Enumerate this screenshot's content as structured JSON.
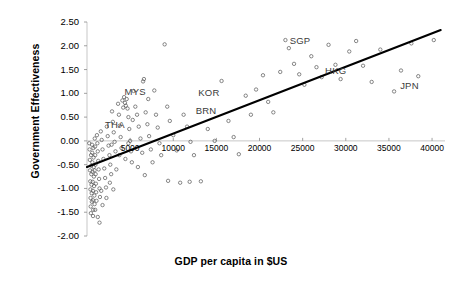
{
  "chart_data": {
    "type": "scatter",
    "title": "",
    "xlabel": "GDP per capita in $US",
    "ylabel": "Government Effectiveness",
    "xlim": [
      0,
      41500
    ],
    "ylim": [
      -2.0,
      2.5
    ],
    "xticks": [
      5000,
      10000,
      15000,
      20000,
      25000,
      30000,
      35000,
      40000
    ],
    "xtick_labels": [
      "5000",
      "10000",
      "15000",
      "20000",
      "25000",
      "30000",
      "35000",
      "40000"
    ],
    "yticks": [
      -2.0,
      -1.5,
      -1.0,
      -0.5,
      0.0,
      0.5,
      1.0,
      1.5,
      2.0,
      2.5
    ],
    "ytick_labels": [
      "-2.00",
      "-1.50",
      "-1.00",
      "-0.50",
      "0.00",
      "0.50",
      "1.00",
      "1.50",
      "2.00",
      "2.50"
    ],
    "grid": false,
    "legend": null,
    "marker": "open-circle",
    "trendline": {
      "type": "linear",
      "x0": 0,
      "y0": -0.55,
      "x1": 41000,
      "y1": 2.33,
      "color": "#000000"
    },
    "annotations": [
      {
        "label": "MYS",
        "x": 4350,
        "y": 1.02
      },
      {
        "label": "THA",
        "x": 2100,
        "y": 0.33
      },
      {
        "label": "KOR",
        "x": 12900,
        "y": 1.0
      },
      {
        "label": "BRN",
        "x": 12600,
        "y": 0.63
      },
      {
        "label": "SGP",
        "x": 23500,
        "y": 2.1
      },
      {
        "label": "HKG",
        "x": 27600,
        "y": 1.46
      },
      {
        "label": "JPN",
        "x": 36300,
        "y": 1.15
      }
    ],
    "points": [
      [
        260,
        -0.05
      ],
      [
        300,
        -0.18
      ],
      [
        330,
        -0.4
      ],
      [
        350,
        -0.62
      ],
      [
        380,
        -0.85
      ],
      [
        400,
        -1.02
      ],
      [
        410,
        -1.2
      ],
      [
        430,
        -1.38
      ],
      [
        450,
        -1.52
      ],
      [
        470,
        -0.3
      ],
      [
        490,
        -0.52
      ],
      [
        500,
        -0.7
      ],
      [
        520,
        -0.92
      ],
      [
        540,
        -1.1
      ],
      [
        560,
        -1.28
      ],
      [
        580,
        -0.08
      ],
      [
        600,
        -0.25
      ],
      [
        620,
        -0.45
      ],
      [
        640,
        -0.65
      ],
      [
        660,
        -0.86
      ],
      [
        680,
        -1.05
      ],
      [
        700,
        -1.25
      ],
      [
        720,
        -1.45
      ],
      [
        740,
        -0.15
      ],
      [
        760,
        -0.35
      ],
      [
        780,
        -0.55
      ],
      [
        800,
        -0.75
      ],
      [
        820,
        -0.95
      ],
      [
        850,
        -1.15
      ],
      [
        880,
        -1.33
      ],
      [
        900,
        0.05
      ],
      [
        930,
        -0.12
      ],
      [
        950,
        -0.3
      ],
      [
        980,
        -0.5
      ],
      [
        1000,
        -0.7
      ],
      [
        1030,
        -0.9
      ],
      [
        1060,
        -1.08
      ],
      [
        1100,
        -1.26
      ],
      [
        1150,
        0.12
      ],
      [
        1200,
        -0.05
      ],
      [
        1250,
        -0.22
      ],
      [
        1300,
        -0.42
      ],
      [
        1350,
        -0.6
      ],
      [
        1400,
        -0.8
      ],
      [
        1450,
        -1.0
      ],
      [
        1500,
        -1.18
      ],
      [
        1600,
        0.2
      ],
      [
        1700,
        0.02
      ],
      [
        1800,
        -0.18
      ],
      [
        1900,
        -0.38
      ],
      [
        2000,
        -0.58
      ],
      [
        2100,
        -0.78
      ],
      [
        2200,
        -0.98
      ],
      [
        2300,
        0.3
      ],
      [
        2400,
        0.1
      ],
      [
        2500,
        -0.1
      ],
      [
        2600,
        -0.3
      ],
      [
        2700,
        -0.5
      ],
      [
        2800,
        -0.7
      ],
      [
        2900,
        0.62
      ],
      [
        3000,
        0.4
      ],
      [
        3100,
        0.18
      ],
      [
        3200,
        -0.02
      ],
      [
        3300,
        -0.22
      ],
      [
        3400,
        -0.6
      ],
      [
        3600,
        0.78
      ],
      [
        3700,
        0.55
      ],
      [
        3800,
        0.32
      ],
      [
        3900,
        0.08
      ],
      [
        4000,
        -0.15
      ],
      [
        4100,
        0.85
      ],
      [
        4200,
        0.7
      ],
      [
        4300,
        0.92
      ],
      [
        4400,
        0.8
      ],
      [
        4500,
        0.74
      ],
      [
        4600,
        0.88
      ],
      [
        4700,
        0.68
      ],
      [
        4800,
        0.5
      ],
      [
        4900,
        0.25
      ],
      [
        5000,
        0.0
      ],
      [
        5100,
        -0.22
      ],
      [
        5200,
        -0.45
      ],
      [
        5400,
        1.05
      ],
      [
        5600,
        0.72
      ],
      [
        5800,
        0.55
      ],
      [
        6000,
        0.3
      ],
      [
        6200,
        0.05
      ],
      [
        6400,
        -0.25
      ],
      [
        6500,
        1.25
      ],
      [
        6600,
        1.3
      ],
      [
        6800,
        0.6
      ],
      [
        7000,
        0.35
      ],
      [
        7200,
        0.1
      ],
      [
        7400,
        -0.18
      ],
      [
        7600,
        -0.45
      ],
      [
        7800,
        1.06
      ],
      [
        8000,
        0.55
      ],
      [
        8200,
        0.28
      ],
      [
        8400,
        -0.05
      ],
      [
        8600,
        -0.3
      ],
      [
        9000,
        2.03
      ],
      [
        9300,
        0.72
      ],
      [
        9600,
        0.42
      ],
      [
        10000,
        0.12
      ],
      [
        10400,
        -0.2
      ],
      [
        10800,
        -0.88
      ],
      [
        11200,
        0.55
      ],
      [
        11600,
        0.3
      ],
      [
        12000,
        -0.02
      ],
      [
        12400,
        -0.3
      ],
      [
        13200,
        -0.85
      ],
      [
        14000,
        0.25
      ],
      [
        14800,
        0.0
      ],
      [
        15600,
        1.26
      ],
      [
        16400,
        0.42
      ],
      [
        17000,
        0.08
      ],
      [
        17600,
        -0.28
      ],
      [
        18400,
        0.95
      ],
      [
        19000,
        0.55
      ],
      [
        19600,
        1.08
      ],
      [
        20400,
        1.38
      ],
      [
        21000,
        0.82
      ],
      [
        21600,
        0.6
      ],
      [
        22400,
        1.45
      ],
      [
        23000,
        2.12
      ],
      [
        23400,
        1.95
      ],
      [
        24000,
        1.62
      ],
      [
        24600,
        1.4
      ],
      [
        25200,
        1.18
      ],
      [
        26000,
        1.78
      ],
      [
        26600,
        1.55
      ],
      [
        27200,
        1.34
      ],
      [
        28000,
        2.02
      ],
      [
        28800,
        1.6
      ],
      [
        29400,
        1.3
      ],
      [
        30400,
        1.88
      ],
      [
        31200,
        2.1
      ],
      [
        32000,
        1.58
      ],
      [
        33000,
        1.24
      ],
      [
        34000,
        1.92
      ],
      [
        35600,
        1.04
      ],
      [
        36400,
        1.48
      ],
      [
        37600,
        2.05
      ],
      [
        38400,
        1.36
      ],
      [
        40200,
        2.12
      ],
      [
        1250,
        -1.6
      ],
      [
        1450,
        -1.72
      ],
      [
        950,
        -1.45
      ],
      [
        1800,
        -1.35
      ],
      [
        700,
        -1.58
      ],
      [
        2650,
        -0.88
      ],
      [
        3050,
        -1.02
      ],
      [
        2250,
        -1.2
      ],
      [
        1650,
        -1.05
      ],
      [
        880,
        -0.62
      ],
      [
        5900,
        -0.55
      ],
      [
        6700,
        -0.72
      ],
      [
        4450,
        -0.38
      ],
      [
        3750,
        -0.3
      ],
      [
        2850,
        -0.08
      ],
      [
        9400,
        -0.84
      ],
      [
        11900,
        -0.86
      ],
      [
        4800,
        -0.05
      ],
      [
        5300,
        0.44
      ],
      [
        7100,
        0.88
      ]
    ]
  }
}
